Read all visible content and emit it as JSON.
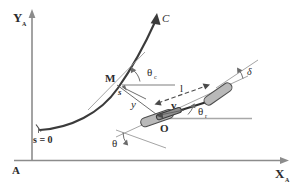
{
  "figure": {
    "type": "diagram",
    "background_color": "#ffffff",
    "axes": {
      "origin_label": "A",
      "x_axis_label": "X",
      "x_axis_sub": "A",
      "y_axis_label": "Y",
      "y_axis_sub": "A"
    },
    "labels": {
      "curve_name": "C",
      "arc_start": "s = 0",
      "arc_length": "s",
      "point_on_path": "M",
      "lateral_error": "y",
      "path_heading": "θ",
      "path_heading_sub": "c",
      "vehicle_origin": "O",
      "wheelbase": "l",
      "velocity": "v",
      "vehicle_heading": "θ",
      "vehicle_heading_sub": "r",
      "steering_angle": "δ",
      "orientation_angle": "θ"
    },
    "colors": {
      "axis": "#8c8c8c",
      "curve": "#3b3b3b",
      "construction": "#9a9a9a",
      "chassis": "#2f2f2f",
      "wheel_fill": "#b9b9b9",
      "text": "#2b2b2b"
    }
  }
}
